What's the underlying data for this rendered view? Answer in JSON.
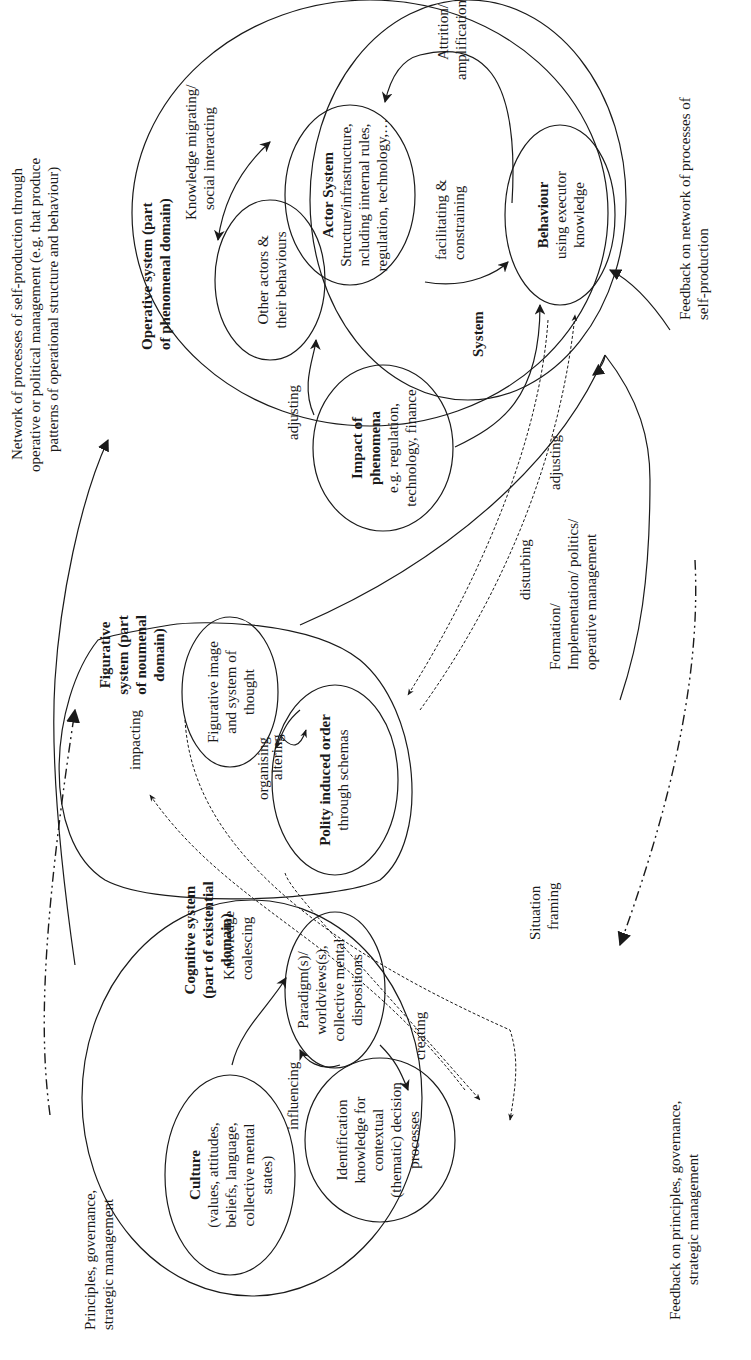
{
  "diagram": {
    "orientation": "rotated 90 degrees counter-clockwise (text reads bottom-to-top)",
    "domains": {
      "operative": {
        "title_line1": "Operative system (part",
        "title_line2": "of phenomenal domain)"
      },
      "figurative": {
        "title_line1": "Figurative",
        "title_line2": "system (part",
        "title_line3": "of noumenal",
        "title_line4": "domain)"
      },
      "cognitive": {
        "title_line1": "Cognitive system",
        "title_line2": "(part of existential",
        "title_line3": "domain)"
      }
    },
    "nodes": {
      "actor_system": {
        "title": "Actor System",
        "line1": "Structure/infrastructure,",
        "line2": "ncluding iinternal rules,",
        "line3": "regulation, technology,…"
      },
      "behaviour": {
        "title": "Behaviour",
        "line1": "using executor",
        "line2": "knowledge"
      },
      "system_label": "System",
      "other_actors": {
        "line1": "Other actors &",
        "line2": "their behaviours"
      },
      "impact": {
        "title1": "Impact of",
        "title2": "phenomena",
        "line1": "e.g. regulation,",
        "line2": "technology, finance"
      },
      "figurative_image": {
        "line1": "Figurative image",
        "line2": "and system of",
        "line3": "thought"
      },
      "polity": {
        "title": "Polity induced order",
        "line1": "through schemas"
      },
      "culture": {
        "title": "Culture",
        "line1": "(values, attitudes,",
        "line2": "beliefs, language,",
        "line3": "collective mental",
        "line4": "states)"
      },
      "paradigm": {
        "line1": "Paradigm(s)/",
        "line2": "worldviews(s),",
        "line3": "collective mental",
        "line4": "dispositions"
      },
      "identification": {
        "line1": "Identification",
        "line2": "knowledge for",
        "line3": "contextual",
        "line4": "(thematic) decision",
        "line5": "processes"
      }
    },
    "edge_labels": {
      "knowledge_migrating_1": "Knowledge migrating/",
      "knowledge_migrating_2": "social interacting",
      "attrition_1": "Attrition/",
      "attrition_2": "amplification",
      "facilitating_1": "facilitating &",
      "facilitating_2": "constraining",
      "adjusting_other": "adjusting",
      "adjusting_behaviour": "adjusting",
      "disturbing": "disturbing",
      "formation_1": "Formation/",
      "formation_2": "Implementation/ politics/",
      "formation_3": "operative management",
      "organising": "organising",
      "altering": "altering",
      "impacting": "impacting",
      "situation_1": "Situation",
      "situation_2": "framing",
      "knowledge_coalescing_1": "Knowledge",
      "knowledge_coalescing_2": "coalescing",
      "creating": "creating",
      "influencing": "influencing"
    },
    "outer_labels": {
      "network_1": "Network of processes of self-production through",
      "network_2": "operative or political management (e.g. that produce",
      "network_3": "patterns of operational structure and behaviour)",
      "feedback_network_1": "Feedback on network of processes of",
      "feedback_network_2": "self-production",
      "principles_1": "Principles, governance,",
      "principles_2": "strategic management",
      "feedback_principles_1": "Feedback on principles, governance,",
      "feedback_principles_2": "strategic management"
    }
  }
}
